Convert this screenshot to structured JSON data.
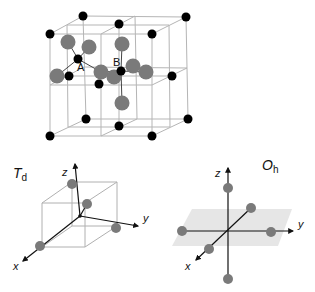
{
  "colors": {
    "cation": "#000000",
    "anion": "#7a7a7a",
    "cell_line": "#b0b0b0",
    "axis": "#111111",
    "plane": "#e6e6e6"
  },
  "crystal": {
    "site_labels": [
      "A",
      "B"
    ]
  },
  "td_panel": {
    "title": "T",
    "subscript": "d",
    "axes": {
      "x": "x",
      "y": "y",
      "z": "z"
    }
  },
  "oh_panel": {
    "title": "O",
    "subscript": "h",
    "axes": {
      "x": "x",
      "y": "y",
      "z": "z"
    }
  }
}
